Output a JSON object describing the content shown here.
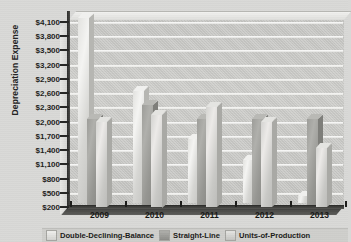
{
  "chart_data": {
    "type": "bar",
    "title": "",
    "subtitle": "",
    "xlabel": "",
    "ylabel": "Depreciation Expense",
    "categories": [
      "2009",
      "2010",
      "2011",
      "2012",
      "2013"
    ],
    "series": [
      {
        "name": "Double-Declining-Balance",
        "values": [
          4100,
          2550,
          1550,
          1100,
          350
        ]
      },
      {
        "name": "Straight-Line",
        "values": [
          2000,
          2300,
          2000,
          2000,
          2000
        ]
      },
      {
        "name": "Units-of-Production",
        "values": [
          2000,
          2150,
          2300,
          2000,
          1450
        ]
      }
    ],
    "ylim": [
      200,
      4100
    ],
    "ytick_step": 300,
    "ytick_labels": [
      "$4,100",
      "$3,800",
      "$3,500",
      "$3,200",
      "$2,900",
      "$2,600",
      "$2,300",
      "$2,000",
      "$1,700",
      "$1,400",
      "$1,100",
      "$800",
      "$500",
      "$200"
    ],
    "ytick_values": [
      4100,
      3800,
      3500,
      3200,
      2900,
      2600,
      2300,
      2000,
      1700,
      1400,
      1100,
      800,
      500,
      200
    ],
    "grid": true,
    "grid_axis": "y",
    "legend_position": "bottom",
    "style": "3d-clustered-column",
    "colors": {
      "double_declining_balance": "#e6e6e3",
      "straight_line": "#9d9d99",
      "units_of_production": "#d3d3d0",
      "plot_background": "#c9c9c6",
      "page_background": "#d9d9d7",
      "axis": "#2c2c2a",
      "gridline": "#f5f5f3"
    }
  },
  "legend": {
    "items": [
      {
        "label": "Double-Declining-Balance"
      },
      {
        "label": "Straight-Line"
      },
      {
        "label": "Units-of-Production"
      }
    ]
  }
}
